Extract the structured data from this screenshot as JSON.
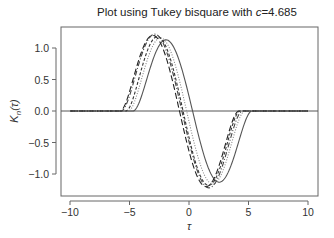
{
  "chart_data": {
    "type": "line",
    "title": "Plot using Tukey bisquare with c=4.685",
    "title_prefix": "Plot using Tukey bisquare with ",
    "title_var": "c",
    "title_value": "=4.685",
    "xlabel": "τ",
    "ylabel": "K_n(τ)",
    "ylabel_main": "K",
    "ylabel_sub": "n",
    "ylabel_arg": "(τ)",
    "xlim": [
      -10.8,
      10.8
    ],
    "ylim": [
      -1.35,
      1.35
    ],
    "xticks": [
      -10,
      -5,
      0,
      5,
      10
    ],
    "xtick_labels": [
      "−10",
      "−5",
      "0",
      "5",
      "10"
    ],
    "yticks": [
      1.0,
      0.5,
      0.0,
      -0.5,
      -1.0
    ],
    "ytick_labels": [
      "1.0",
      "0.5",
      "0.0",
      "−0.5",
      "−1.0"
    ],
    "grid": false,
    "reference_line": {
      "y": 0
    },
    "series": [
      {
        "name": "solid",
        "style": "solid",
        "color": "#555555",
        "shift": 0.3,
        "width": 1.0,
        "amp": 1.13,
        "points": [
          [
            -10,
            0
          ],
          [
            -5.6,
            0
          ],
          [
            -4,
            0.5
          ],
          [
            -1.8,
            1.13
          ],
          [
            0.3,
            0
          ],
          [
            2.2,
            -1.15
          ],
          [
            4.5,
            -0.4
          ],
          [
            6,
            0
          ],
          [
            10,
            0
          ]
        ]
      },
      {
        "name": "long-dash",
        "style": "dash-long",
        "color": "#222222",
        "shift": -0.8,
        "width": 1.0,
        "amp": 1.2,
        "points": [
          [
            -10,
            0
          ],
          [
            -6.3,
            0
          ],
          [
            -4.8,
            0.6
          ],
          [
            -2.7,
            1.2
          ],
          [
            -0.8,
            0
          ],
          [
            1.4,
            -1.18
          ],
          [
            3.7,
            -0.3
          ],
          [
            5,
            0
          ],
          [
            10,
            0
          ]
        ]
      },
      {
        "name": "short-dash",
        "style": "dash-short",
        "color": "#333333",
        "shift": -0.5,
        "width": 0.96,
        "amp": 1.18,
        "points": [
          [
            -10,
            0
          ],
          [
            -6,
            0
          ],
          [
            -2.4,
            1.18
          ],
          [
            -0.5,
            0
          ],
          [
            1.7,
            -1.2
          ],
          [
            5.3,
            0
          ],
          [
            10,
            0
          ]
        ]
      },
      {
        "name": "dotted",
        "style": "dotted",
        "color": "#888888",
        "shift": -0.2,
        "width": 0.98,
        "amp": 1.16,
        "points": [
          [
            -10,
            0
          ],
          [
            -5.8,
            0
          ],
          [
            -2.1,
            1.16
          ],
          [
            -0.2,
            0
          ],
          [
            1.9,
            -1.19
          ],
          [
            5.6,
            0
          ],
          [
            10,
            0
          ]
        ]
      },
      {
        "name": "dash-dot",
        "style": "dash-dot",
        "color": "#444444",
        "shift": -0.6,
        "width": 1.02,
        "amp": 1.22,
        "points": [
          [
            -10,
            0
          ],
          [
            -6.2,
            0
          ],
          [
            -2.5,
            1.22
          ],
          [
            -0.6,
            0
          ],
          [
            1.5,
            -1.22
          ],
          [
            5.1,
            0
          ],
          [
            10,
            0
          ]
        ]
      }
    ]
  }
}
